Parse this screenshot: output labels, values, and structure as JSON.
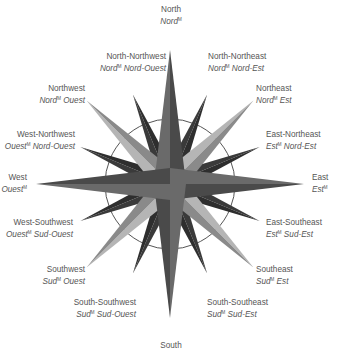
{
  "diagram": {
    "colors": {
      "light": "#9a9a9a",
      "mid": "#6a6a6a",
      "dark": "#3a3a3a",
      "circle": "#555555",
      "text": "#555555"
    },
    "center": [
      170,
      184
    ],
    "circle_radius": 65,
    "labels": {
      "n": {
        "en": "North",
        "fr_a": "Nord",
        "fr_b": ""
      },
      "nnw": {
        "en": "North-Northwest",
        "fr_a": "Nord",
        "fr_b": " Nord-Ouest"
      },
      "nne": {
        "en": "North-Northeast",
        "fr_a": "Nord",
        "fr_b": " Nord-Est"
      },
      "nw": {
        "en": "Northwest",
        "fr_a": "Nord",
        "fr_b": " Ouest"
      },
      "ne": {
        "en": "Northeast",
        "fr_a": "Nord",
        "fr_b": " Est"
      },
      "wnw": {
        "en": "West-Northwest",
        "fr_a": "Ouest",
        "fr_b": " Nord-Ouest"
      },
      "ene": {
        "en": "East-Northeast",
        "fr_a": "Est",
        "fr_b": " Nord-Est"
      },
      "w": {
        "en": "West",
        "fr_a": "Ouest",
        "fr_b": ""
      },
      "e": {
        "en": "East",
        "fr_a": "Est",
        "fr_b": ""
      },
      "wsw": {
        "en": "West-Southwest",
        "fr_a": "Ouest",
        "fr_b": " Sud-Ouest"
      },
      "ese": {
        "en": "East-Southeast",
        "fr_a": "Est",
        "fr_b": " Sud-Est"
      },
      "sw": {
        "en": "Southwest",
        "fr_a": "Sud",
        "fr_b": " Ouest"
      },
      "se": {
        "en": "Southeast",
        "fr_a": "Sud",
        "fr_b": " Est"
      },
      "ssw": {
        "en": "South-Southwest",
        "fr_a": "Sud",
        "fr_b": " Sud-Ouest"
      },
      "sse": {
        "en": "South-Southeast",
        "fr_a": "Sud",
        "fr_b": " Sud-Est"
      },
      "s": {
        "en": "South",
        "fr_a": "",
        "fr_b": ""
      }
    },
    "superscript": "M"
  }
}
